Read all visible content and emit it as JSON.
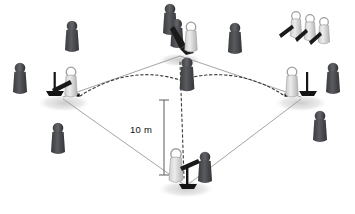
{
  "figure": {
    "type": "diagram",
    "background_color": "#ffffff"
  },
  "annotations": {
    "dimension_label": "10 m",
    "dimension_label_x": 130,
    "dimension_label_y": 124
  },
  "colors": {
    "dark_person": "#4f5052",
    "dark_person_shade": "#35363a",
    "light_person": "#d8d8d8",
    "light_person_shade": "#bdbdbd",
    "outline": "#6f6f6f",
    "field_line": "#9a9a9a",
    "dashed_line": "#3a3a3a",
    "shadow": "#d9d9d9",
    "bat": "#1c1c1c",
    "tee": "#141414",
    "text": "#111111"
  },
  "field": {
    "shape": "diamond",
    "corners": [
      {
        "name": "top-base",
        "x": 180,
        "y": 55
      },
      {
        "name": "left-base",
        "x": 62,
        "y": 97
      },
      {
        "name": "bottom-base",
        "x": 185,
        "y": 185
      },
      {
        "name": "right-base",
        "x": 302,
        "y": 97
      }
    ],
    "line_width": 0.9
  },
  "trajectories": [
    {
      "name": "arc-left",
      "from_x": 80,
      "from_y": 96,
      "ctrl_x": 132,
      "ctrl_y": 66,
      "to_x": 180,
      "to_y": 80
    },
    {
      "name": "arc-right",
      "from_x": 180,
      "from_y": 80,
      "ctrl_x": 238,
      "ctrl_y": 66,
      "to_x": 285,
      "to_y": 96
    },
    {
      "name": "vertical-drop",
      "from_x": 180,
      "from_y": 62,
      "to_x": 184,
      "to_y": 178
    }
  ],
  "markers": [
    {
      "name": "arc-dot-left",
      "x": 79,
      "y": 96
    },
    {
      "name": "arc-dot-right",
      "x": 286,
      "y": 96
    }
  ],
  "shadows": [
    {
      "x": 180,
      "y": 60,
      "rx": 22,
      "ry": 7
    },
    {
      "x": 64,
      "y": 102,
      "rx": 26,
      "ry": 8
    },
    {
      "x": 300,
      "y": 102,
      "rx": 26,
      "ry": 8
    },
    {
      "x": 185,
      "y": 188,
      "rx": 27,
      "ry": 8
    }
  ],
  "people": {
    "dark_figures": [
      {
        "name": "observer-top-center",
        "x": 170,
        "y": 18,
        "scale": 1.0
      },
      {
        "name": "observer-top-left",
        "x": 72,
        "y": 32,
        "scale": 1.0
      },
      {
        "name": "observer-top-right",
        "x": 235,
        "y": 34,
        "scale": 1.0
      },
      {
        "name": "observer-left-outer",
        "x": 20,
        "y": 74,
        "scale": 1.0
      },
      {
        "name": "observer-left-lower",
        "x": 58,
        "y": 134,
        "scale": 1.0
      },
      {
        "name": "observer-right-outer",
        "x": 333,
        "y": 74,
        "scale": 1.0
      },
      {
        "name": "observer-right-lower",
        "x": 320,
        "y": 122,
        "scale": 1.0
      },
      {
        "name": "observer-center-field",
        "x": 187,
        "y": 70,
        "scale": 1.05
      },
      {
        "name": "observer-bottom-base",
        "x": 205,
        "y": 163,
        "scale": 1.0
      },
      {
        "name": "observer-top-base",
        "x": 177,
        "y": 30,
        "scale": 0.95
      }
    ],
    "light_figures": [
      {
        "name": "batter-top-base",
        "x": 190,
        "y": 32,
        "scale": 0.95,
        "bat": "left"
      },
      {
        "name": "batter-left-base",
        "x": 70,
        "y": 78,
        "scale": 0.95,
        "bat": "left"
      },
      {
        "name": "batter-right-base",
        "x": 293,
        "y": 78,
        "scale": 0.95,
        "bat": "none"
      },
      {
        "name": "batter-bottom-base",
        "x": 175,
        "y": 160,
        "scale": 1.0,
        "bat": "right"
      },
      {
        "name": "waiting-player-1",
        "x": 296,
        "y": 20,
        "scale": 0.85,
        "bat": "left"
      },
      {
        "name": "waiting-player-2",
        "x": 310,
        "y": 22,
        "scale": 0.85,
        "bat": "left"
      },
      {
        "name": "waiting-player-3",
        "x": 324,
        "y": 24,
        "scale": 0.85,
        "bat": "left"
      }
    ],
    "tees": [
      {
        "name": "tee-left-base",
        "x": 55,
        "y": 86
      },
      {
        "name": "tee-right-base",
        "x": 307,
        "y": 86
      },
      {
        "name": "tee-bottom-base",
        "x": 188,
        "y": 168
      },
      {
        "name": "bat-top-base",
        "x": 182,
        "y": 38
      }
    ]
  }
}
